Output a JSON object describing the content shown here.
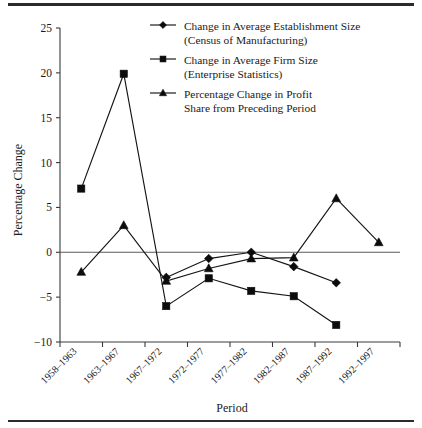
{
  "chart_data": {
    "type": "line",
    "title": "",
    "xlabel": "Period",
    "ylabel": "Percentage Change",
    "categories": [
      "1958–1963",
      "1963–1967",
      "1967–1972",
      "1972–1977",
      "1977–1982",
      "1982–1987",
      "1987–1992",
      "1992–1997"
    ],
    "ylim": [
      -10,
      25
    ],
    "yticks": [
      -10,
      -5,
      0,
      5,
      10,
      15,
      20,
      25
    ],
    "ytick_labels": [
      "−10",
      "−5",
      "0",
      "5",
      "10",
      "15",
      "20",
      "25"
    ],
    "grid": false,
    "legend_position": "top-right",
    "zero_line": true,
    "series": [
      {
        "name": "Change in Average Establishment Size\n(Census of Manufacturing)",
        "label_line1": "Change in Average Establishment Size",
        "label_line2": "(Census of Manufacturing)",
        "marker": "diamond",
        "x": [
          "1967–1972",
          "1972–1977",
          "1977–1982",
          "1982–1987",
          "1987–1992"
        ],
        "values": [
          -2.8,
          -0.7,
          0.0,
          -1.6,
          -3.4
        ]
      },
      {
        "name": "Change in  Average Firm  Size\n(Enterprise Statistics)",
        "label_line1": "Change in  Average Firm  Size",
        "label_line2": "(Enterprise Statistics)",
        "marker": "square",
        "x": [
          "1958–1963",
          "1963–1967",
          "1967–1972",
          "1972–1977",
          "1977–1982",
          "1982–1987",
          "1987–1992"
        ],
        "values": [
          7.1,
          19.9,
          -6.0,
          -2.9,
          -4.3,
          -4.9,
          -8.1
        ]
      },
      {
        "name": "Percentage Change in Profit\nShare from Preceding Period",
        "label_line1": "Percentage Change in Profit",
        "label_line2": "Share from Preceding Period",
        "marker": "triangle",
        "x": [
          "1958–1963",
          "1963–1967",
          "1967–1972",
          "1972–1977",
          "1977–1982",
          "1982–1987",
          "1987–1992",
          "1992–1997"
        ],
        "values": [
          -2.2,
          3.0,
          -3.2,
          -1.8,
          -0.7,
          -0.6,
          6.0,
          1.1
        ]
      }
    ]
  },
  "legend": {
    "entries": [
      {
        "marker": "diamond",
        "line1": "Change in Average Establishment Size",
        "line2": "(Census of Manufacturing)"
      },
      {
        "marker": "square",
        "line1": "Change in  Average Firm  Size",
        "line2": "(Enterprise Statistics)"
      },
      {
        "marker": "triangle",
        "line1": "Percentage Change in Profit",
        "line2": "Share from Preceding Period"
      }
    ]
  },
  "colors": {
    "ink": "#141414",
    "axis": "#3a3a3a",
    "zero": "#5a5a5a",
    "background": "#ffffff"
  }
}
